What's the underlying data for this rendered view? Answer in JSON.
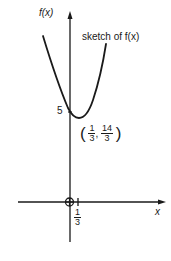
{
  "diagram": {
    "type": "function-sketch",
    "y_axis_label": "f(x)",
    "x_axis_label": "x",
    "curve_label": "sketch of f(x)",
    "y_intercept_label": "5",
    "x_tick_label": {
      "numerator": "1",
      "denominator": "3"
    },
    "vertex_label": {
      "x": {
        "numerator": "1",
        "denominator": "3"
      },
      "separator": ",",
      "y": {
        "numerator": "14",
        "denominator": "3"
      }
    },
    "origin_marker": "circle-with-cross",
    "curve": {
      "shape": "parabola-opening-up",
      "vertex": [
        0.3333,
        4.6667
      ],
      "y_intercept": 5
    },
    "colors": {
      "ink": "#1a1a1a",
      "background": "#ffffff"
    }
  }
}
